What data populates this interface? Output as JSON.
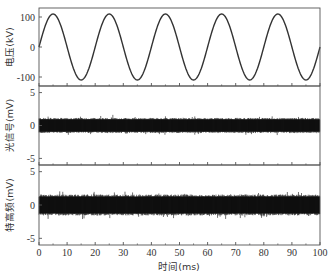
{
  "chart_data": {
    "type": "line",
    "layout": "3 vertically stacked panels sharing x-axis",
    "xlabel": "时间(ms)",
    "xlim": [
      0,
      100
    ],
    "xticks": [
      0,
      10,
      20,
      30,
      40,
      50,
      60,
      70,
      80,
      90,
      100
    ],
    "xtick_labels": [
      "0",
      "10",
      "20",
      "30",
      "40",
      "50",
      "60",
      "70",
      "80",
      "90",
      "100"
    ],
    "grid": false,
    "legend": null,
    "panels": [
      {
        "id": "voltage",
        "ylabel": "电压(kV)",
        "ylim": [
          -130,
          130
        ],
        "yticks": [
          100,
          0,
          -100
        ],
        "ytick_labels": [
          "100",
          "0",
          "-100"
        ],
        "series": [
          {
            "name": "电压",
            "kind": "sine",
            "amplitude": 110,
            "period_ms": 20,
            "frequency_hz": 50,
            "phase_start": 0,
            "peaks_ms": [
              5,
              25,
              45,
              65,
              85
            ],
            "troughs_ms": [
              15,
              35,
              55,
              75,
              95
            ],
            "color": "#333333"
          }
        ]
      },
      {
        "id": "optical-signal",
        "ylabel": "光信号(mV)",
        "ylim": [
          -6,
          6
        ],
        "yticks": [
          5,
          0,
          -5
        ],
        "ytick_labels": [
          "5",
          "0",
          "-5"
        ],
        "series": [
          {
            "name": "光信号",
            "kind": "noise",
            "mean": 0,
            "band": [
              -1.1,
              1.1
            ],
            "max_spike": 1.6,
            "color": "#111111"
          }
        ]
      },
      {
        "id": "uhf",
        "ylabel": "特高频(mV)",
        "ylim": [
          -6,
          6
        ],
        "yticks": [
          5,
          0,
          -5
        ],
        "ytick_labels": [
          "5",
          "0",
          "-5"
        ],
        "series": [
          {
            "name": "特高频",
            "kind": "noise",
            "mean": 0,
            "band": [
              -1.5,
              1.5
            ],
            "max_spike": 2.2,
            "color": "#111111"
          }
        ]
      }
    ]
  }
}
